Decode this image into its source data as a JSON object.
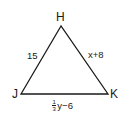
{
  "figure": {
    "type": "triangle",
    "stroke_color": "#1a1a1a",
    "background": "#ffffff",
    "vertices": [
      {
        "label": "H",
        "x": 61,
        "y": 26
      },
      {
        "label": "J",
        "x": 21,
        "y": 94
      },
      {
        "label": "K",
        "x": 108,
        "y": 94
      }
    ],
    "sides": {
      "HJ": {
        "label": "15"
      },
      "HK": {
        "label": "x+8"
      },
      "JK": {
        "fraction_numerator": "1",
        "fraction_denominator": "3",
        "expression_rest": "y−6"
      }
    }
  }
}
